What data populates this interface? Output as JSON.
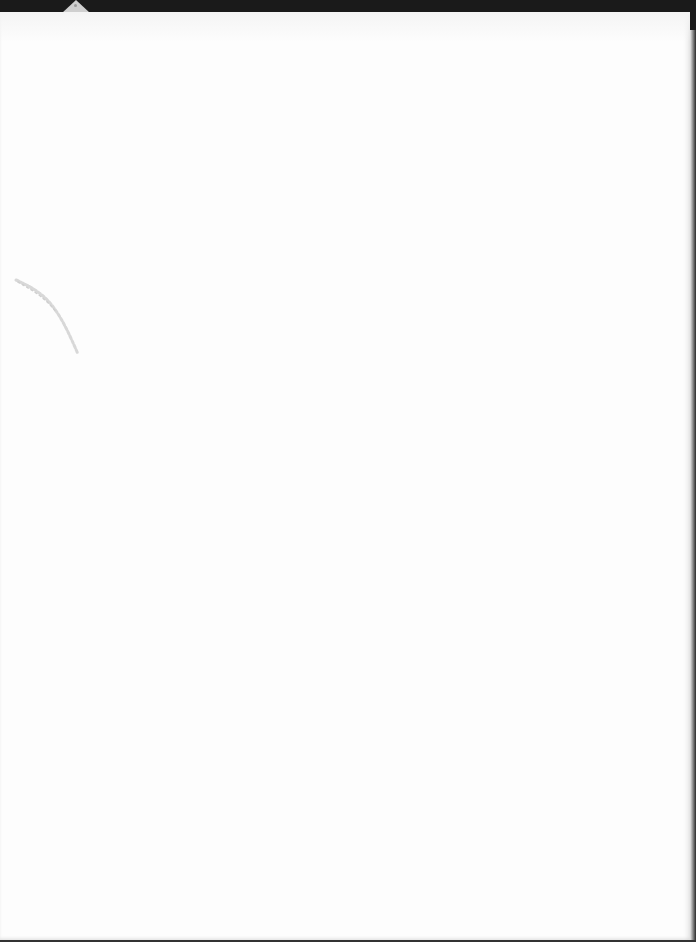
{
  "document": {
    "type": "scanned-page",
    "content": "",
    "background_color": "#fdfdfd",
    "border_color": "#1a1a1a",
    "marks": [
      {
        "kind": "smudge",
        "description": "faint diagonal pencil/scan mark"
      },
      {
        "kind": "tab",
        "description": "small gray triangular tab at top-left edge"
      }
    ]
  }
}
